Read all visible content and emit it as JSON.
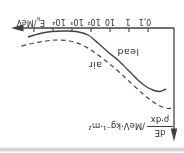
{
  "figure": {
    "x_axis_title": {
      "symbol": "E",
      "subscript": "k",
      "unit": "/MeV"
    },
    "y_axis_title": {
      "numerator": "dE",
      "denominator": "ρ·dx",
      "unit": "/MeV·kg⁻¹·m²"
    }
  },
  "chart_data": {
    "type": "line",
    "title": "",
    "xlabel": "Ek/MeV",
    "ylabel": "dE/(ρ·dx) /MeV·kg⁻¹·m²",
    "x_axis": {
      "scale": "log",
      "tick_labels": [
        "0,1",
        "1",
        "10",
        "10²",
        "10³",
        "10⁴"
      ],
      "tick_log10_values": [
        -1,
        0,
        1,
        2,
        3,
        4
      ],
      "extra_unlabeled_tick_log10": 5
    },
    "y_axis": {
      "numeric_ticks": false,
      "note": "y-axis unlabeled; values below are relative units estimated from pixels"
    },
    "presentation": {
      "rotated_degrees": 180,
      "note": "entire scanned figure appears upside down in the screenshot"
    },
    "legend_position": "inline-labels",
    "grid": false,
    "series": [
      {
        "name": "lead",
        "line_style": "solid",
        "points_log10E_vs_rel": [
          [
            -1.95,
            61
          ],
          [
            -1.63,
            63.5
          ],
          [
            -1.32,
            62.5
          ],
          [
            -0.89,
            58.5
          ],
          [
            -0.47,
            52
          ],
          [
            0.05,
            42
          ],
          [
            0.58,
            32
          ],
          [
            1.11,
            24
          ],
          [
            1.63,
            15
          ],
          [
            2.16,
            7
          ],
          [
            2.79,
            3.5
          ],
          [
            3.42,
            3
          ],
          [
            4.05,
            3.5
          ],
          [
            4.68,
            5.5
          ],
          [
            5.32,
            9
          ]
        ]
      },
      {
        "name": "air",
        "line_style": "dashed",
        "points_log10E_vs_rel": [
          [
            -2.21,
            80
          ],
          [
            -2.05,
            80.5
          ],
          [
            -1.63,
            78
          ],
          [
            -1.21,
            73
          ],
          [
            -0.68,
            65
          ],
          [
            -0.05,
            54
          ],
          [
            0.58,
            43
          ],
          [
            1.21,
            33
          ],
          [
            1.84,
            24
          ],
          [
            2.47,
            17
          ],
          [
            3.11,
            13
          ],
          [
            3.74,
            12
          ],
          [
            4.37,
            13
          ],
          [
            5.11,
            15.5
          ],
          [
            5.84,
            19
          ]
        ]
      }
    ],
    "colors": {
      "ink": "#414141",
      "scan_band": "#bdbdbd",
      "background": "#ffffff"
    }
  }
}
